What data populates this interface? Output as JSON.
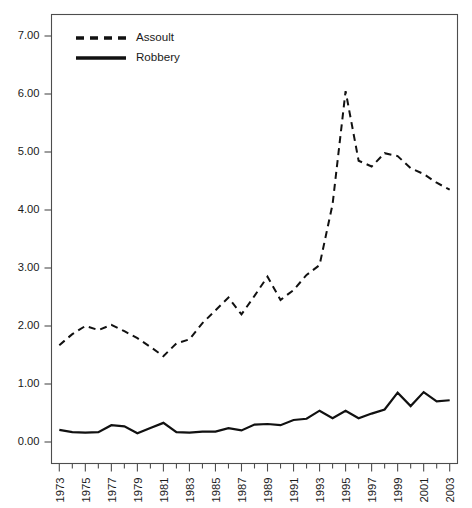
{
  "chart_data": {
    "type": "line",
    "title": "",
    "subtitle": "",
    "xlabel": "",
    "ylabel": "",
    "xlim": [
      1972.4,
      2003.6
    ],
    "ylim": [
      0.0,
      7.45
    ],
    "grid": false,
    "legend_position": "top-left-inside",
    "y_ticks": [
      0.0,
      1.0,
      2.0,
      3.0,
      4.0,
      5.0,
      6.0,
      7.0
    ],
    "y_tick_labels": [
      "0.00",
      "1.00",
      "2.00",
      "3.00",
      "4.00",
      "5.00",
      "6.00",
      "7.00"
    ],
    "x": [
      1973,
      1974,
      1975,
      1976,
      1977,
      1978,
      1979,
      1980,
      1981,
      1982,
      1983,
      1984,
      1985,
      1986,
      1987,
      1988,
      1989,
      1990,
      1991,
      1992,
      1993,
      1994,
      1995,
      1996,
      1997,
      1998,
      1999,
      2000,
      2001,
      2002,
      2003
    ],
    "x_tick_values": [
      1973,
      1975,
      1977,
      1979,
      1981,
      1983,
      1985,
      1987,
      1989,
      1991,
      1993,
      1995,
      1997,
      1999,
      2001,
      2003
    ],
    "x_tick_labels": [
      "1973",
      "1975",
      "1977",
      "1979",
      "1981",
      "1983",
      "1985",
      "1987",
      "1989",
      "1991",
      "1993",
      "1995",
      "1997",
      "1999",
      "2001",
      "2003"
    ],
    "x_minor_tick_values": [
      1974,
      1976,
      1978,
      1980,
      1982,
      1984,
      1986,
      1988,
      1990,
      1992,
      1994,
      1996,
      1998,
      2000,
      2002
    ],
    "series": [
      {
        "name": "Assoult",
        "style": "dashed",
        "color": "#111111",
        "values": [
          1.67,
          1.86,
          2.0,
          1.93,
          2.02,
          1.91,
          1.79,
          1.64,
          1.48,
          1.7,
          1.77,
          2.05,
          2.27,
          2.49,
          2.2,
          2.52,
          2.85,
          2.45,
          2.62,
          2.88,
          3.05,
          4.1,
          6.05,
          4.85,
          4.75,
          4.98,
          4.93,
          4.72,
          4.62,
          4.47,
          4.35
        ]
      },
      {
        "name": "Robbery",
        "style": "solid",
        "color": "#111111",
        "values": [
          0.21,
          0.17,
          0.16,
          0.17,
          0.29,
          0.27,
          0.15,
          0.24,
          0.33,
          0.17,
          0.16,
          0.18,
          0.18,
          0.24,
          0.2,
          0.3,
          0.31,
          0.29,
          0.38,
          0.4,
          0.54,
          0.41,
          0.54,
          0.41,
          0.49,
          0.56,
          0.85,
          0.62,
          0.86,
          0.7,
          0.72
        ]
      }
    ]
  },
  "legend": {
    "entries": [
      {
        "label": "Assoult",
        "style": "dashed"
      },
      {
        "label": "Robbery",
        "style": "solid"
      }
    ]
  }
}
